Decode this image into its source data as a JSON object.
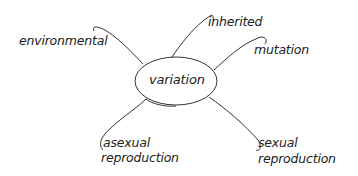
{
  "diagram": {
    "type": "mind-map",
    "center": {
      "label": "variation"
    },
    "branches": [
      {
        "id": "environmental",
        "label": "environmental"
      },
      {
        "id": "inherited",
        "label": "inherited"
      },
      {
        "id": "mutation",
        "label": "mutation"
      },
      {
        "id": "asexual",
        "line1": "asexual",
        "line2": "reproduction"
      },
      {
        "id": "sexual",
        "line1": "sexual",
        "line2": "reproduction"
      }
    ],
    "colors": {
      "stroke": "#333333",
      "text": "#222222",
      "background": "#ffffff"
    }
  }
}
